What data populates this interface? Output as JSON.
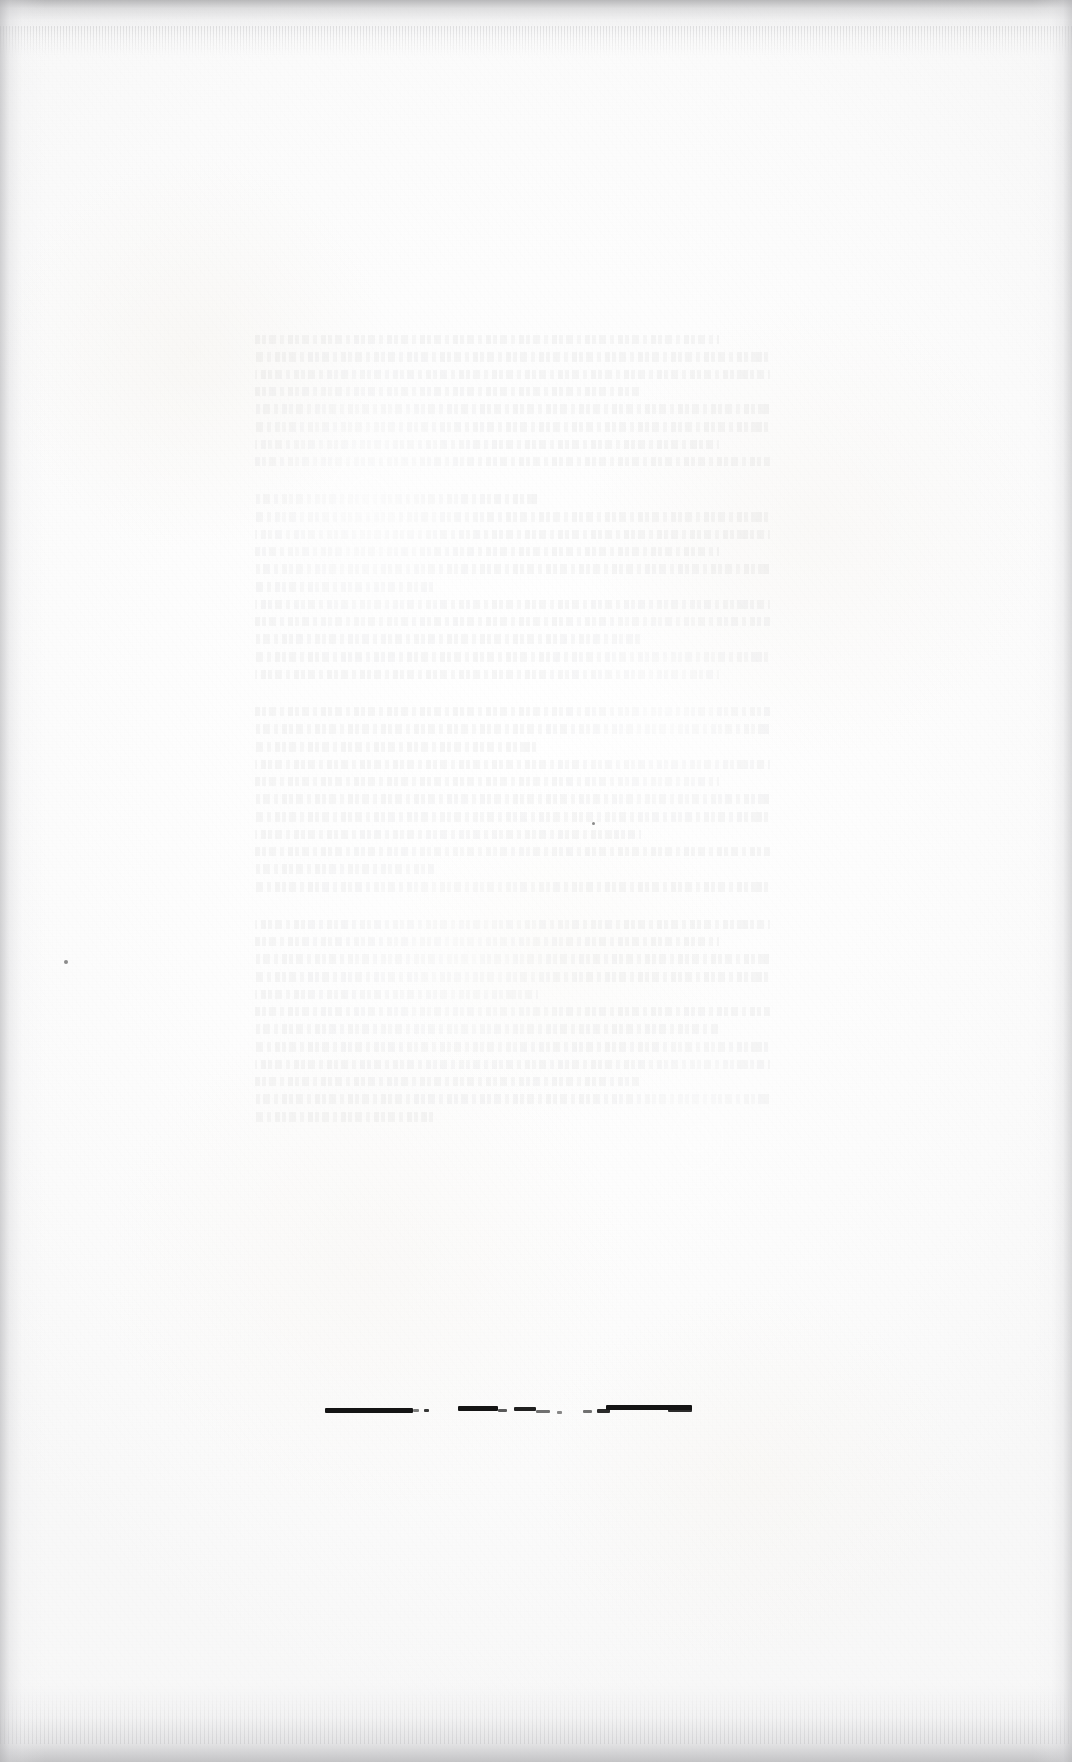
{
  "document": {
    "kind": "scanned-page",
    "page_state": "blank",
    "description": "Blank verso of a scanned book leaf. No printed text on this side; only faint show-through from the reverse and a broken ink rule near the foot of the page.",
    "width": 1072,
    "height": 1762,
    "paper_color": "#fdfdfd",
    "ink_color": "#141414",
    "scan_border_color": "#b0b0b3"
  },
  "visible_text": {
    "headings": [],
    "body": [],
    "page_number": "",
    "note": "No legible characters are rendered on this side of the leaf."
  },
  "showthrough_block": {
    "label": "show-through from reverse side",
    "left": 255,
    "top": 335,
    "width": 515,
    "height": 935,
    "opacity": 0.04,
    "lines": [
      {
        "style": "v1",
        "width": "short-90"
      },
      {
        "style": "v2",
        "width": "full"
      },
      {
        "style": "v3",
        "width": "full"
      },
      {
        "style": "v1",
        "width": "short-75"
      },
      {
        "style": "v4",
        "width": "full"
      },
      {
        "style": "v2",
        "width": "full"
      },
      {
        "style": "v3",
        "width": "short-90"
      },
      {
        "style": "v1",
        "width": "full"
      },
      {
        "style": "v4",
        "width": "short-55"
      },
      {
        "style": "v2",
        "width": "full"
      },
      {
        "style": "v3",
        "width": "full"
      },
      {
        "style": "v1",
        "width": "short-90"
      },
      {
        "style": "v4",
        "width": "full"
      },
      {
        "style": "v2",
        "width": "short-35"
      },
      {
        "style": "v3",
        "width": "full"
      },
      {
        "style": "v1",
        "width": "full"
      },
      {
        "style": "v4",
        "width": "short-75"
      },
      {
        "style": "v2",
        "width": "full"
      },
      {
        "style": "v3",
        "width": "short-90"
      },
      {
        "style": "v1",
        "width": "full"
      },
      {
        "style": "v4",
        "width": "full"
      },
      {
        "style": "v2",
        "width": "short-55"
      },
      {
        "style": "v3",
        "width": "full"
      },
      {
        "style": "v1",
        "width": "short-90"
      },
      {
        "style": "v4",
        "width": "full"
      },
      {
        "style": "v2",
        "width": "full"
      },
      {
        "style": "v3",
        "width": "short-75"
      },
      {
        "style": "v1",
        "width": "full"
      },
      {
        "style": "v4",
        "width": "short-35"
      },
      {
        "style": "v2",
        "width": "full"
      },
      {
        "style": "v3",
        "width": "full"
      },
      {
        "style": "v1",
        "width": "short-90"
      },
      {
        "style": "v4",
        "width": "full"
      },
      {
        "style": "v2",
        "width": "full"
      },
      {
        "style": "v3",
        "width": "short-55"
      },
      {
        "style": "v1",
        "width": "full"
      },
      {
        "style": "v4",
        "width": "short-90"
      },
      {
        "style": "v2",
        "width": "full"
      },
      {
        "style": "v3",
        "width": "full"
      },
      {
        "style": "v1",
        "width": "short-75"
      },
      {
        "style": "v4",
        "width": "full"
      },
      {
        "style": "v2",
        "width": "short-35"
      }
    ]
  },
  "ink_rule": {
    "label": "broken horizontal ink rule near foot of page",
    "top": 1404,
    "left": 0,
    "strokes": [
      {
        "x": 325,
        "y": 1408,
        "w": 88,
        "h": 5,
        "opacity": 1.0
      },
      {
        "x": 413,
        "y": 1409,
        "w": 6,
        "h": 3,
        "opacity": 0.55
      },
      {
        "x": 424,
        "y": 1409,
        "w": 5,
        "h": 3,
        "opacity": 0.85
      },
      {
        "x": 458,
        "y": 1406,
        "w": 40,
        "h": 5,
        "opacity": 1.0
      },
      {
        "x": 498,
        "y": 1409,
        "w": 9,
        "h": 3,
        "opacity": 0.7
      },
      {
        "x": 514,
        "y": 1407,
        "w": 22,
        "h": 4,
        "opacity": 0.95
      },
      {
        "x": 536,
        "y": 1410,
        "w": 14,
        "h": 3,
        "opacity": 0.6
      },
      {
        "x": 557,
        "y": 1411,
        "w": 5,
        "h": 3,
        "opacity": 0.5
      },
      {
        "x": 583,
        "y": 1410,
        "w": 9,
        "h": 3,
        "opacity": 0.6
      },
      {
        "x": 597,
        "y": 1409,
        "w": 13,
        "h": 4,
        "opacity": 0.9
      },
      {
        "x": 606,
        "y": 1405,
        "w": 86,
        "h": 5,
        "opacity": 1.0
      },
      {
        "x": 668,
        "y": 1408,
        "w": 24,
        "h": 4,
        "opacity": 0.9
      }
    ]
  },
  "specks": [
    {
      "x": 64,
      "y": 960,
      "size": 4,
      "label": "margin-speck-left"
    },
    {
      "x": 592,
      "y": 822,
      "size": 3,
      "label": "margin-speck-center"
    }
  ]
}
